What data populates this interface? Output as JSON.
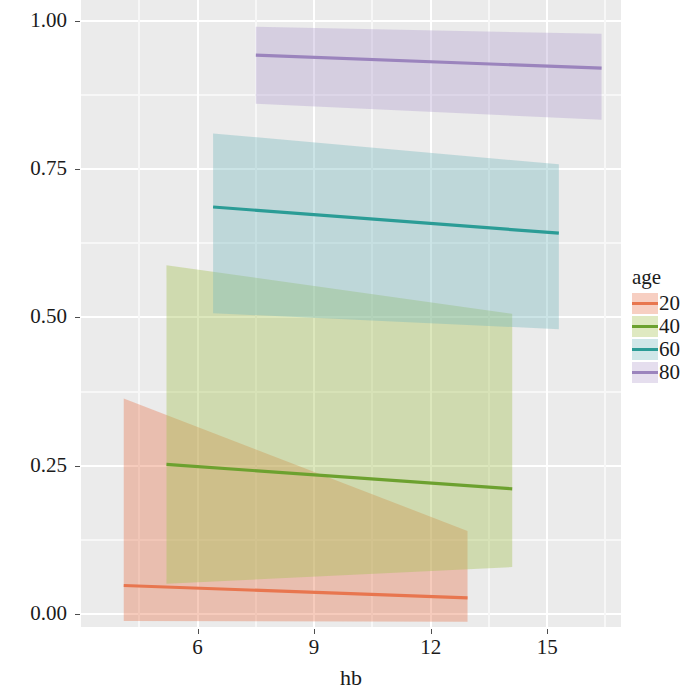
{
  "chart_data": {
    "type": "line",
    "title": "",
    "xlabel": "hb",
    "ylabel": "Predictedprob",
    "xlim": [
      3.0,
      16.9
    ],
    "ylim": [
      -0.022,
      1.035
    ],
    "xticks": [
      6,
      9,
      12,
      15
    ],
    "xtick_labels": [
      "6",
      "9",
      "12",
      "15"
    ],
    "yticks": [
      0.0,
      0.25,
      0.5,
      0.75,
      1.0
    ],
    "ytick_labels": [
      "0.00",
      "0.25",
      "0.50",
      "0.75",
      "1.00"
    ],
    "grid": true,
    "legend": {
      "title": "age",
      "position": "right",
      "entries": [
        {
          "label": "20",
          "color": "#E8764F"
        },
        {
          "label": "40",
          "color": "#6CA12F"
        },
        {
          "label": "60",
          "color": "#2B9C96"
        },
        {
          "label": "80",
          "color": "#9B84BD"
        }
      ]
    },
    "series": [
      {
        "name": "20",
        "color": "#E8764F",
        "ribbon_color": "#E8764F",
        "x": [
          4.1,
          12.95
        ],
        "y": [
          0.048,
          0.027
        ],
        "ci_lower": [
          -0.012,
          -0.013
        ],
        "ci_upper": [
          0.363,
          0.14
        ]
      },
      {
        "name": "40",
        "color": "#6CA12F",
        "ribbon_color": "#A3BF4E",
        "x": [
          5.2,
          14.1
        ],
        "y": [
          0.252,
          0.211
        ],
        "ci_lower": [
          0.051,
          0.079
        ],
        "ci_upper": [
          0.588,
          0.506
        ]
      },
      {
        "name": "60",
        "color": "#2B9C96",
        "ribbon_color": "#76B9BC",
        "x": [
          6.4,
          15.3
        ],
        "y": [
          0.686,
          0.642
        ],
        "ci_lower": [
          0.507,
          0.48
        ],
        "ci_upper": [
          0.81,
          0.758
        ]
      },
      {
        "name": "80",
        "color": "#9B84BD",
        "ribbon_color": "#B4A0CF",
        "x": [
          7.5,
          16.4
        ],
        "y": [
          0.942,
          0.92
        ],
        "ci_lower": [
          0.86,
          0.833
        ],
        "ci_upper": [
          0.99,
          0.978
        ]
      }
    ]
  },
  "axis": {
    "x_label": "hb",
    "y_label": "Predictedprob"
  },
  "legend": {
    "title": "age",
    "items": [
      {
        "label": "20"
      },
      {
        "label": "40"
      },
      {
        "label": "60"
      },
      {
        "label": "80"
      }
    ]
  },
  "ticks": {
    "y": [
      {
        "label": "1.00"
      },
      {
        "label": "0.75"
      },
      {
        "label": "0.50"
      },
      {
        "label": "0.25"
      },
      {
        "label": "0.00"
      }
    ],
    "x": [
      {
        "label": "6"
      },
      {
        "label": "9"
      },
      {
        "label": "12"
      },
      {
        "label": "15"
      }
    ]
  }
}
